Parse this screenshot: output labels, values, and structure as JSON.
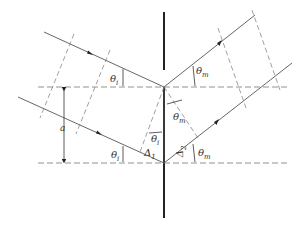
{
  "diagram": {
    "type": "reflection-geometry",
    "colors": {
      "line": "#555555",
      "barrier": "#222222",
      "dashed": "#777777",
      "background": "#ffffff"
    },
    "labels": {
      "theta_i_top": {
        "sym": "θ",
        "sub": "i"
      },
      "theta_m_top": {
        "sym": "θ",
        "sub": "m"
      },
      "a": "a",
      "theta_i_mid": {
        "sym": "θ",
        "sub": "i"
      },
      "theta_m_mid": {
        "sym": "θ",
        "sub": "m"
      },
      "delta_1": {
        "sym": "Δ",
        "sub": "1"
      },
      "delta_2": {
        "sym": "Δ",
        "sub": "2"
      },
      "theta_i_bottom": {
        "sym": "θ",
        "sub": "i"
      },
      "theta_m_bottom": {
        "sym": "θ",
        "sub": "m"
      }
    }
  }
}
